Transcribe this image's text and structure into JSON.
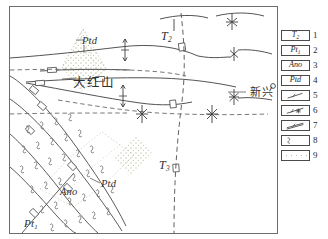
{
  "figure": {
    "type": "geological-map",
    "frame": {
      "x": 9,
      "y": 6,
      "width": 267,
      "height": 226
    }
  },
  "map_labels": [
    {
      "id": "t2",
      "text": "T",
      "sub": "2",
      "note": "Middle Triassic unit"
    },
    {
      "id": "t3",
      "text": "T",
      "sub": "3",
      "note": "Upper Triassic unit"
    },
    {
      "id": "pt1",
      "text": "Pt",
      "sub": "1",
      "note": "Lower Proterozoic basement"
    },
    {
      "id": "ptd-top",
      "text": "Ptd",
      "sub": "",
      "note": "Ptd body upper-left"
    },
    {
      "id": "ptd-bottom",
      "text": "Ptd",
      "sub": "",
      "note": "Ptd body lower-left"
    },
    {
      "id": "ano-bottom",
      "text": "Ano",
      "sub": "",
      "note": "Ano body lower-left"
    },
    {
      "id": "dahongshan",
      "text": "大红山",
      "sub": "",
      "note": "place name"
    },
    {
      "id": "xinxing",
      "text": "新兴",
      "sub": "",
      "note": "place name with point marker"
    }
  ],
  "legend": {
    "items": [
      {
        "num": "1",
        "kind": "box-text",
        "label": "T",
        "sub": "2",
        "name": "legend-unit-t2"
      },
      {
        "num": "2",
        "kind": "box-text",
        "label": "Pt",
        "sub": "1",
        "name": "legend-unit-pt1"
      },
      {
        "num": "3",
        "kind": "box-text",
        "label": "Ano",
        "sub": "",
        "name": "legend-unit-ano"
      },
      {
        "num": "4",
        "kind": "box-text",
        "label": "Ptd",
        "sub": "",
        "name": "legend-unit-ptd"
      },
      {
        "num": "5",
        "kind": "symbol-line",
        "label": "",
        "sub": "",
        "name": "legend-symbol-fault"
      },
      {
        "num": "6",
        "kind": "symbol-line-star",
        "label": "",
        "sub": "",
        "name": "legend-symbol-ore-fault"
      },
      {
        "num": "7",
        "kind": "symbol-line-double",
        "label": "",
        "sub": "",
        "name": "legend-symbol-vein"
      },
      {
        "num": "8",
        "kind": "symbol-hook",
        "label": "",
        "sub": "",
        "name": "legend-symbol-schistosity"
      },
      {
        "num": "9",
        "kind": "symbol-stipple",
        "label": "",
        "sub": "",
        "name": "legend-symbol-alteration"
      }
    ]
  },
  "colors": {
    "ink": "#2f2f2f",
    "line": "#4a4a4a",
    "frame": "#6d6d6d",
    "stipple": "#b4b49a",
    "paper": "#ffffff"
  }
}
